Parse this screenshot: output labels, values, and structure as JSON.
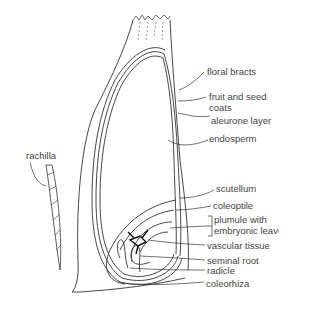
{
  "diagram": {
    "labels": [
      {
        "id": "floral-bracts",
        "text": "floral bracts"
      },
      {
        "id": "fruit-seed-coats",
        "text": "fruit and seed",
        "text2": "coats"
      },
      {
        "id": "aleurone-layer",
        "text": "aleurone layer"
      },
      {
        "id": "endosperm",
        "text": "endosperm"
      },
      {
        "id": "rachilla",
        "text": "rachilla"
      },
      {
        "id": "scutellum",
        "text": "scutellum"
      },
      {
        "id": "coleoptile",
        "text": "coleoptile"
      },
      {
        "id": "plumule",
        "text": "plumule with",
        "text2": "embryonic leaves"
      },
      {
        "id": "vascular-tissue",
        "text": "vascular tissue"
      },
      {
        "id": "seminal-root",
        "text": "seminal root"
      },
      {
        "id": "radicle",
        "text": "radicle"
      },
      {
        "id": "coleorhiza",
        "text": "coleorhiza"
      }
    ]
  }
}
